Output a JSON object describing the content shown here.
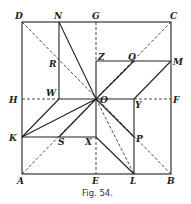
{
  "figure": {
    "caption": "Fig. 54.",
    "points": {
      "A": "A",
      "B": "B",
      "C": "C",
      "D": "D",
      "E": "E",
      "F": "F",
      "G": "G",
      "H": "H",
      "K": "K",
      "L": "L",
      "M": "M",
      "N": "N",
      "O": "O",
      "P": "P",
      "Q": "Q",
      "R": "R",
      "S": "S",
      "W": "W",
      "X": "X",
      "Y": "Y",
      "Z": "Z"
    },
    "colors": {
      "line": "#222222",
      "background": "#ffffff"
    }
  }
}
